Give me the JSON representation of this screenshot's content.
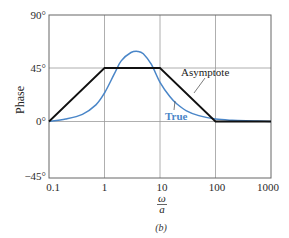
{
  "chart_data": {
    "type": "line",
    "title": "",
    "xlabel": "ω/a",
    "ylabel": "Phase",
    "caption": "(b)",
    "x_scale": "log",
    "xlim": [
      0.1,
      1000
    ],
    "ylim": [
      -45,
      90
    ],
    "x_ticks": [
      0.1,
      1,
      10,
      100,
      1000
    ],
    "x_tick_labels": [
      "0.1",
      "1",
      "10",
      "100",
      "1000"
    ],
    "y_ticks": [
      -45,
      0,
      45,
      90
    ],
    "y_tick_labels": [
      "−45°",
      "0°",
      "45°",
      "90°"
    ],
    "grid": true,
    "series": [
      {
        "name": "Asymptote",
        "color": "#111111",
        "x": [
          0.1,
          1,
          10,
          100,
          1000
        ],
        "y": [
          0,
          45,
          45,
          0,
          0
        ]
      },
      {
        "name": "True",
        "color": "#4a86c8",
        "x": [
          0.1,
          0.2,
          0.4,
          0.7,
          1,
          1.5,
          2,
          3,
          4,
          5,
          7,
          10,
          15,
          20,
          30,
          50,
          100,
          200,
          500,
          1000
        ],
        "y": [
          0,
          2,
          6,
          14,
          24,
          40,
          51,
          58,
          59,
          57,
          48,
          33,
          21,
          15,
          9,
          5,
          2,
          1,
          0.5,
          0
        ]
      }
    ],
    "annotations": [
      {
        "text": "Asymptote",
        "color": "#111111"
      },
      {
        "text": "True",
        "color": "#4a86c8"
      }
    ]
  },
  "labels": {
    "ylabel": "Phase",
    "x_num": "ω",
    "x_den": "a",
    "caption": "(b)",
    "asymptote": "Asymptote",
    "true": "True",
    "y90": "90°",
    "y45": "45°",
    "y0": "0°",
    "ym45": "−45°",
    "x01": "0.1",
    "x1": "1",
    "x10": "10",
    "x100": "100",
    "x1000": "1000"
  }
}
